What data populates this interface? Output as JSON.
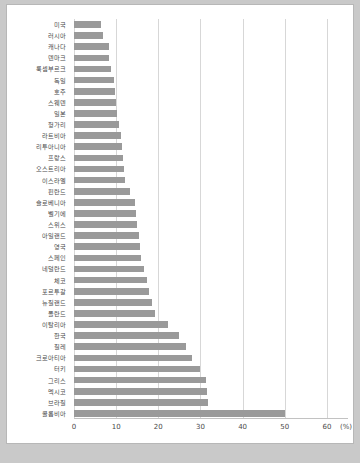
{
  "chart_data": {
    "type": "bar",
    "orientation": "horizontal",
    "title": "",
    "xlabel": "(%)",
    "ylabel": "",
    "xlim": [
      0,
      65
    ],
    "ticks": [
      0,
      10,
      20,
      30,
      40,
      50,
      60
    ],
    "tick_labels": [
      "0",
      "10",
      "20",
      "30",
      "40",
      "50",
      "60"
    ],
    "unit_label": "(%)",
    "grid": "vertical",
    "legend": "none",
    "bar_color": "#9a9a9a",
    "categories": [
      "미국",
      "러시아",
      "캐나다",
      "덴마크",
      "룩셈부르크",
      "독일",
      "호주",
      "스웨덴",
      "일본",
      "헝가리",
      "라트비아",
      "리투아니아",
      "프랑스",
      "오스트리아",
      "이스라엘",
      "핀란드",
      "슬로베니아",
      "벨기에",
      "스위스",
      "아일랜드",
      "영국",
      "스페인",
      "네덜란드",
      "체코",
      "포르투갈",
      "뉴질랜드",
      "폴란드",
      "이탈리아",
      "한국",
      "칠레",
      "크로아티아",
      "터키",
      "그리스",
      "멕시코",
      "브라질",
      "콜롬비아"
    ],
    "values": [
      6.4,
      6.8,
      8.2,
      8.4,
      8.8,
      9.6,
      9.8,
      10.0,
      10.2,
      10.6,
      11.2,
      11.4,
      11.6,
      11.8,
      12.0,
      13.2,
      14.4,
      14.6,
      15.0,
      15.4,
      15.6,
      16.0,
      16.6,
      17.4,
      17.8,
      18.6,
      19.2,
      22.4,
      25.0,
      26.6,
      28.0,
      30.0,
      31.4,
      31.6,
      31.8,
      50.0
    ]
  },
  "caption": {
    "bottom_clipped_text": ""
  }
}
